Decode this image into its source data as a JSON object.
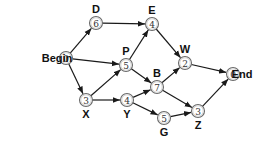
{
  "diagram": {
    "type": "activity-network",
    "colors": {
      "edge": "#1a1a1a",
      "node_stroke": "#6a6a6a",
      "label": "#111111"
    },
    "nodes": [
      {
        "id": "begin",
        "label": "Begin",
        "value": "0",
        "x": 66,
        "y": 58,
        "label_pos": "left"
      },
      {
        "id": "D",
        "label": "D",
        "value": "6",
        "x": 96,
        "y": 23,
        "label_pos": "top"
      },
      {
        "id": "E",
        "label": "E",
        "value": "4",
        "x": 152,
        "y": 24,
        "label_pos": "top"
      },
      {
        "id": "P",
        "label": "P",
        "value": "5",
        "x": 126,
        "y": 65,
        "label_pos": "top"
      },
      {
        "id": "W",
        "label": "W",
        "value": "2",
        "x": 185,
        "y": 63,
        "label_pos": "top"
      },
      {
        "id": "end",
        "label": "End",
        "value": "0",
        "x": 233,
        "y": 74,
        "label_pos": "right"
      },
      {
        "id": "X",
        "label": "X",
        "value": "3",
        "x": 86,
        "y": 100,
        "label_pos": "bottom"
      },
      {
        "id": "Y",
        "label": "Y",
        "value": "4",
        "x": 127,
        "y": 100,
        "label_pos": "bottom"
      },
      {
        "id": "B",
        "label": "B",
        "value": "7",
        "x": 157,
        "y": 87,
        "label_pos": "top"
      },
      {
        "id": "G",
        "label": "G",
        "value": "5",
        "x": 164,
        "y": 118,
        "label_pos": "bottom"
      },
      {
        "id": "Z",
        "label": "Z",
        "value": "3",
        "x": 198,
        "y": 111,
        "label_pos": "bottom"
      }
    ],
    "edges": [
      {
        "from": "begin",
        "to": "D"
      },
      {
        "from": "begin",
        "to": "P"
      },
      {
        "from": "begin",
        "to": "X"
      },
      {
        "from": "D",
        "to": "E"
      },
      {
        "from": "P",
        "to": "E"
      },
      {
        "from": "E",
        "to": "W"
      },
      {
        "from": "X",
        "to": "P"
      },
      {
        "from": "X",
        "to": "Y"
      },
      {
        "from": "P",
        "to": "B"
      },
      {
        "from": "Y",
        "to": "B"
      },
      {
        "from": "Y",
        "to": "G"
      },
      {
        "from": "B",
        "to": "W"
      },
      {
        "from": "B",
        "to": "Z"
      },
      {
        "from": "G",
        "to": "Z"
      },
      {
        "from": "W",
        "to": "end"
      },
      {
        "from": "Z",
        "to": "end"
      }
    ]
  }
}
